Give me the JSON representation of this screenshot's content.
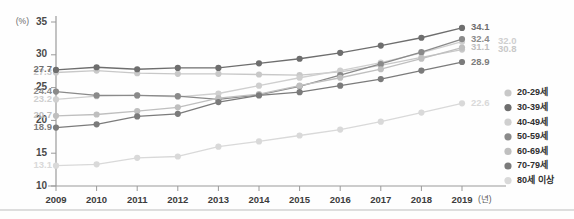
{
  "chart_data": {
    "type": "line",
    "title": "",
    "xlabel": "(년)",
    "ylabel": "(%)",
    "unit_y": "(%)",
    "unit_x": "(년)",
    "categories": [
      "2009",
      "2010",
      "2011",
      "2012",
      "2013",
      "2014",
      "2015",
      "2016",
      "2017",
      "2018",
      "2019"
    ],
    "x": [
      2009,
      2010,
      2011,
      2012,
      2013,
      2014,
      2015,
      2016,
      2017,
      2018,
      2019
    ],
    "ylim": [
      10,
      35
    ],
    "yticks": [
      10,
      15,
      20,
      25,
      30,
      35
    ],
    "xlim": [
      2009,
      2019
    ],
    "grid": false,
    "legend_position": "right",
    "series": [
      {
        "name": "20-29세",
        "color": "#c8c8c8",
        "start_label": "27.3",
        "end_label": "30.8",
        "end_label_offset": "right",
        "values": [
          27.3,
          27.6,
          27.2,
          27.1,
          27.1,
          27.0,
          26.9,
          27.4,
          28.4,
          29.6,
          30.8
        ]
      },
      {
        "name": "30-39세",
        "color": "#6e6e6e",
        "start_label": "27.7",
        "end_label": "34.1",
        "end_label_offset": "normal",
        "values": [
          27.7,
          28.1,
          27.8,
          28.0,
          28.0,
          28.7,
          29.4,
          30.3,
          31.4,
          32.6,
          34.1
        ]
      },
      {
        "name": "40-49세",
        "color": "#cfcfcf",
        "start_label": "23.2",
        "end_label": "32.0",
        "end_label_offset": "right",
        "values": [
          23.2,
          23.7,
          23.8,
          23.6,
          24.1,
          25.3,
          26.5,
          27.6,
          28.8,
          30.3,
          32.0
        ]
      },
      {
        "name": "50-59세",
        "color": "#8a8a8a",
        "start_label": "24.4",
        "end_label": "32.4",
        "end_label_offset": "normal",
        "values": [
          24.4,
          23.8,
          23.8,
          23.7,
          23.2,
          23.9,
          25.2,
          26.9,
          28.6,
          30.4,
          32.4
        ]
      },
      {
        "name": "60-69세",
        "color": "#bfbfbf",
        "start_label": "20.7",
        "end_label": "31.1",
        "end_label_offset": "normal",
        "values": [
          20.7,
          20.9,
          21.4,
          22.0,
          23.4,
          24.0,
          25.3,
          26.5,
          27.8,
          29.4,
          31.1
        ]
      },
      {
        "name": "70-79세",
        "color": "#7b7b7b",
        "start_label": "18.9",
        "end_label": "28.9",
        "end_label_offset": "normal",
        "values": [
          18.9,
          19.4,
          20.6,
          21.0,
          22.8,
          23.8,
          24.3,
          25.3,
          26.3,
          27.6,
          28.9
        ]
      },
      {
        "name": "80세 이상",
        "color": "#d9d9d9",
        "start_label": "13.1",
        "end_label": "22.6",
        "end_label_offset": "normal",
        "values": [
          13.1,
          13.3,
          14.3,
          14.5,
          16.0,
          16.8,
          17.7,
          18.6,
          19.8,
          21.2,
          22.6
        ]
      }
    ]
  },
  "legend": {
    "items": [
      {
        "label": "20-29세",
        "color": "#c8c8c8"
      },
      {
        "label": "30-39세",
        "color": "#6e6e6e"
      },
      {
        "label": "40-49세",
        "color": "#cfcfcf"
      },
      {
        "label": "50-59세",
        "color": "#8a8a8a"
      },
      {
        "label": "60-69세",
        "color": "#bfbfbf"
      },
      {
        "label": "70-79세",
        "color": "#7b7b7b"
      },
      {
        "label": "80세 이상",
        "color": "#d9d9d9"
      }
    ]
  },
  "axes": {
    "y_unit": "(%)",
    "y_ticks": [
      "35",
      "30",
      "25",
      "20",
      "15",
      "10"
    ],
    "x_ticks": [
      "2009",
      "2010",
      "2011",
      "2012",
      "2013",
      "2014",
      "2015",
      "2016",
      "2017",
      "2018",
      "2019"
    ],
    "x_unit": "(년)"
  }
}
